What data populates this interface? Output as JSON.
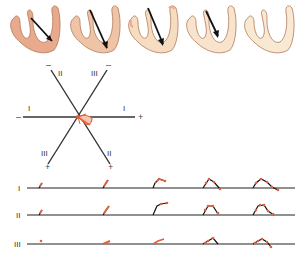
{
  "hearts": [
    {
      "fill": "#e8a98c",
      "inner": "#f3c9ae",
      "depolarized": 1.0
    },
    {
      "fill": "#efc4a6",
      "inner": "#e8a98c",
      "depolarized": 0.7
    },
    {
      "fill": "#f6dcc0",
      "inner": "#f6dcc0",
      "depolarized": 0.4
    },
    {
      "fill": "#f8e4cc",
      "inner": "#f8e4cc",
      "depolarized": 0.2
    },
    {
      "fill": "#f9e8d2",
      "inner": "#f9e8d2",
      "depolarized": 0.0
    }
  ],
  "axis_diagram": {
    "leads": [
      {
        "name": "I",
        "neg_label": "–",
        "pos_label": "+"
      },
      {
        "name": "II",
        "neg_label": "–",
        "pos_label": "+"
      },
      {
        "name": "III",
        "neg_label": "–",
        "pos_label": "+"
      }
    ],
    "labels": {
      "lead1_left": "I",
      "lead1_right": "I",
      "lead2_top": "II",
      "lead2_bottom": "II",
      "lead3_top": "III",
      "lead3_bottom": "III",
      "minus": "–",
      "plus": "+"
    }
  },
  "traces": {
    "rows": [
      {
        "lead": "I"
      },
      {
        "lead": "II"
      },
      {
        "lead": "III"
      }
    ]
  },
  "colors": {
    "line": "#222222",
    "accent": "#e2603c",
    "outline": "#b07a5a"
  }
}
